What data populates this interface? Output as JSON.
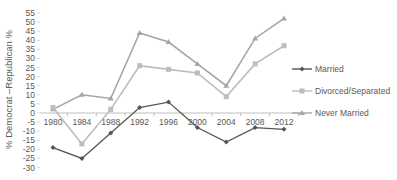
{
  "chart_data": {
    "type": "line",
    "title": "",
    "xlabel": "",
    "ylabel": "% Democrat –Republican %",
    "categories": [
      "1980",
      "1984",
      "1988",
      "1992",
      "1996",
      "2000",
      "2004",
      "2008",
      "2012"
    ],
    "yticks": [
      55,
      50,
      45,
      40,
      35,
      30,
      25,
      20,
      15,
      10,
      5,
      0,
      -5,
      -10,
      -15,
      -20,
      -25,
      -30
    ],
    "ylim": [
      -30,
      55
    ],
    "grid": false,
    "legend_position": "right",
    "series": [
      {
        "name": "Married",
        "color": "#555555",
        "marker": "diamond",
        "values": [
          -19,
          -25,
          -11,
          3,
          6,
          -8,
          -16,
          -8,
          -9
        ]
      },
      {
        "name": "Divorced/Separated",
        "color": "#bdbdbd",
        "marker": "square",
        "values": [
          3,
          -17,
          2,
          26,
          24,
          22,
          9,
          27,
          37
        ]
      },
      {
        "name": "Never Married",
        "color": "#a6a6a6",
        "marker": "triangle",
        "values": [
          2,
          10,
          8,
          44,
          39,
          27,
          15,
          41,
          52
        ]
      }
    ]
  }
}
